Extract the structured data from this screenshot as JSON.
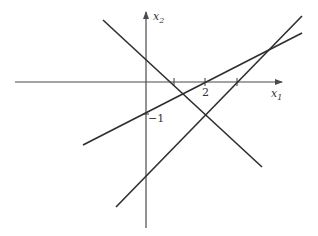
{
  "diagram": {
    "axes": {
      "x_label": "x",
      "x_subscript": "1",
      "y_label": "x",
      "y_subscript": "2"
    },
    "tick_labels": {
      "x_two": "2",
      "y_minus_one": "−1"
    },
    "colors": {
      "axis": "#4a4a4a",
      "line": "#2e2e2e",
      "background": "#ffffff"
    },
    "lines": [
      {
        "name": "descending-line",
        "from": [
          103,
          20
        ],
        "to": [
          262,
          167
        ]
      },
      {
        "name": "shallow-ascending-line",
        "from": [
          83,
          145
        ],
        "to": [
          302,
          33
        ]
      },
      {
        "name": "steep-ascending-line",
        "from": [
          116,
          207
        ],
        "to": [
          302,
          16
        ]
      }
    ]
  }
}
